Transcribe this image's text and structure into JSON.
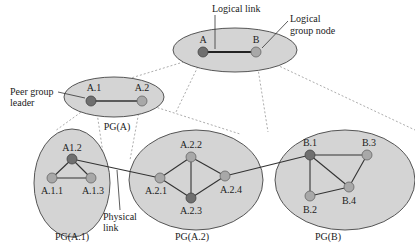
{
  "annotations": {
    "logical_link": "Logical link",
    "logical_group_node_line1": "Logical",
    "logical_group_node_line2": "group node",
    "peer_group_leader_line1": "Peer group",
    "peer_group_leader_line2": "leader",
    "physical_link_line1": "Physical",
    "physical_link_line2": "link"
  },
  "groups": {
    "top": {
      "nodes": {
        "a": "A",
        "b": "B"
      }
    },
    "pg_a": {
      "label": "PG(A)",
      "nodes": {
        "a1": "A.1",
        "a2": "A.2"
      }
    },
    "pg_a1": {
      "label": "PG(A.1)",
      "nodes": {
        "a12": "A1.2",
        "a11": "A.1.1",
        "a13": "A.1.3"
      }
    },
    "pg_a2": {
      "label": "PG(A.2)",
      "nodes": {
        "a21": "A.2.1",
        "a22": "A.2.2",
        "a23": "A.2.3",
        "a24": "A.2.4"
      }
    },
    "pg_b": {
      "label": "PG(B)",
      "nodes": {
        "b1": "B.1",
        "b2": "B.2",
        "b3": "B.3",
        "b4": "B.4"
      }
    }
  },
  "colors": {
    "group_fill": "#d4d4d4",
    "leader_node": "#6f6f6f",
    "regular_node": "#a8a8a8"
  }
}
